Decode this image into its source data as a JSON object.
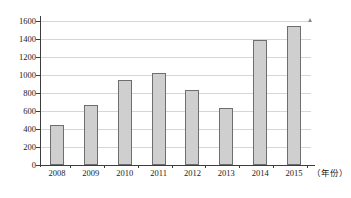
{
  "chart_data": {
    "type": "bar",
    "title": "",
    "subtitle": "",
    "xlabel": "（年份）",
    "ylabel": "",
    "categories": [
      "2008",
      "2009",
      "2010",
      "2011",
      "2012",
      "2013",
      "2014",
      "2015"
    ],
    "values": [
      450,
      670,
      950,
      1020,
      830,
      630,
      1390,
      1540
    ],
    "series": [
      {
        "name": "",
        "values": [
          450,
          670,
          950,
          1020,
          830,
          630,
          1390,
          1540
        ]
      }
    ],
    "ylim": [
      0,
      1600
    ],
    "ytick_labels": [
      "0",
      "200",
      "400",
      "600",
      "800",
      "1000",
      "1200",
      "1400",
      "1600"
    ],
    "ytick_values": [
      0,
      200,
      400,
      600,
      800,
      1000,
      1200,
      1400,
      1600
    ],
    "grid": true,
    "grid_axis": "y",
    "legend": false,
    "legend_position": "none",
    "bar_fill_color": "#cfcfcf",
    "bar_edge_color": "#6e6e6e",
    "axis_color": "#3d3d3d",
    "grid_color": "#d6d6d6",
    "background_color": "#ffffff"
  }
}
